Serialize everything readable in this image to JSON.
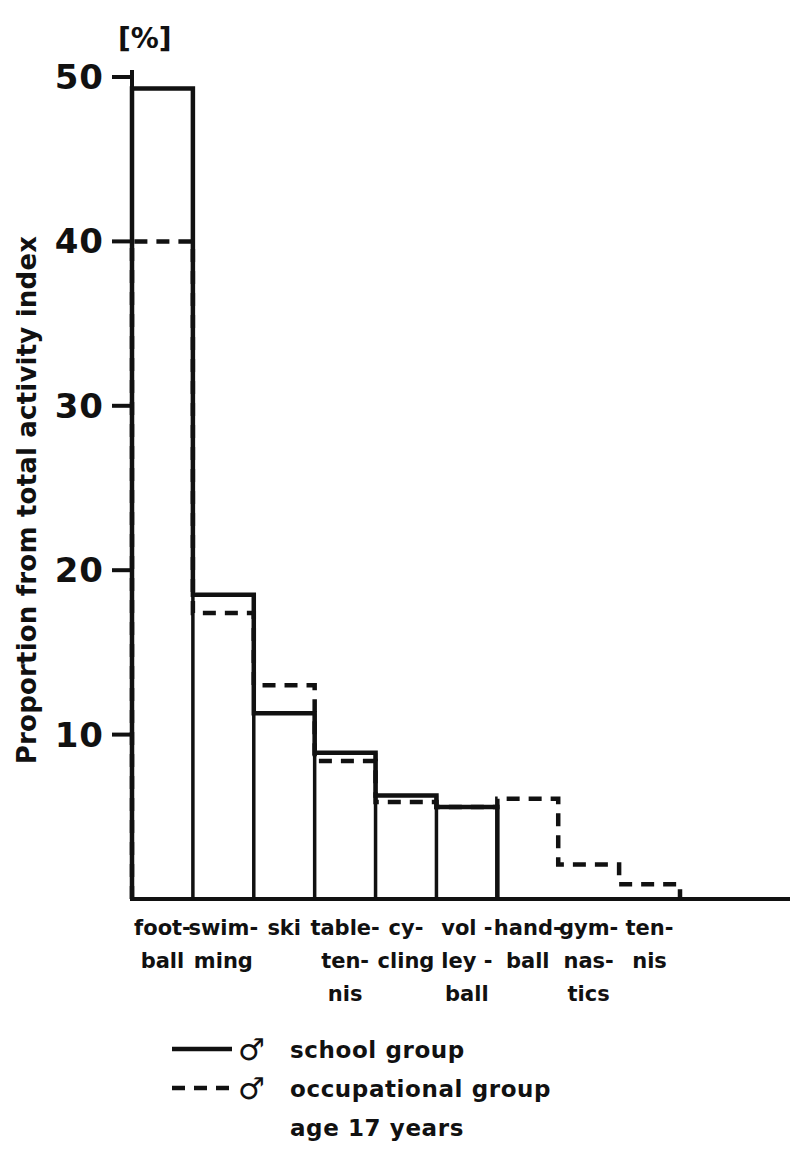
{
  "chart_data": {
    "type": "bar",
    "title": "",
    "subtitle": "",
    "xlabel": "",
    "ylabel": "Proportion from total activity index",
    "unit_label": "[%]",
    "ylim": [
      0,
      50
    ],
    "yticks": [
      10,
      20,
      30,
      40,
      50
    ],
    "ytick_labels": [
      "10",
      "20",
      "30",
      "40",
      "50"
    ],
    "grid": false,
    "legend_position": "below-plot",
    "categories": [
      "foot-ball",
      "swim-ming",
      "ski",
      "table-ten-nis",
      "cy-cling",
      "vol-ley-ball",
      "hand-ball",
      "gym-nas-tics",
      "ten-nis"
    ],
    "category_lines": [
      [
        "foot-",
        "ball",
        ""
      ],
      [
        "swim-",
        "ming",
        ""
      ],
      [
        "ski",
        "",
        ""
      ],
      [
        "table-",
        "ten-",
        "nis"
      ],
      [
        "cy-",
        "cling",
        ""
      ],
      [
        "vol -",
        "ley -",
        "ball"
      ],
      [
        "hand-",
        "ball",
        ""
      ],
      [
        "gym-",
        "nas-",
        "tics"
      ],
      [
        "ten-",
        "nis",
        ""
      ]
    ],
    "series": [
      {
        "name": "school group",
        "style": "solid",
        "values": [
          49.3,
          18.5,
          11.3,
          8.9,
          6.3,
          5.6,
          0,
          0,
          0
        ]
      },
      {
        "name": "occupational group",
        "style": "dashed",
        "values": [
          40.0,
          17.4,
          13.0,
          8.4,
          5.9,
          5.6,
          6.1,
          2.1,
          0.9
        ]
      }
    ],
    "colors": {
      "ink": "#111111",
      "background": "#ffffff"
    }
  },
  "legend": {
    "entries": [
      {
        "style": "solid",
        "symbol": "male",
        "label": "school group"
      },
      {
        "style": "dashed",
        "symbol": "male",
        "label": "occupational group"
      }
    ],
    "note": "age 17 years"
  }
}
